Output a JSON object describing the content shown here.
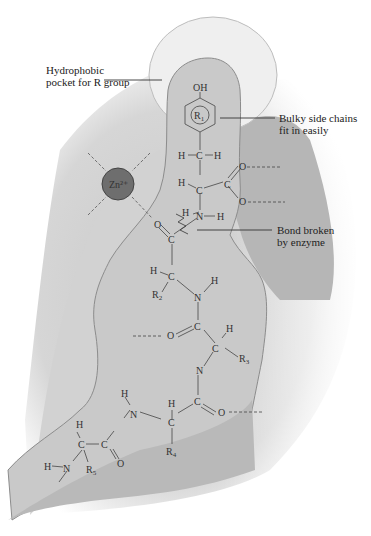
{
  "diagram": {
    "labels": {
      "hydrophobic_pocket": [
        "Hydrophobic",
        "pocket for R group"
      ],
      "bulky_side_chains": [
        "Bulky side chains",
        "fit in easily"
      ],
      "bond_broken": [
        "Bond broken",
        "by enzyme"
      ]
    },
    "metal_ion": {
      "symbol": "Zn",
      "charge": "2+",
      "color": "#6e6e6e"
    },
    "residues": [
      "R1",
      "R2",
      "R3",
      "R4",
      "R5"
    ],
    "atoms": {
      "hydroxyl": "OH",
      "ring_label": "R",
      "ring_sub": "1",
      "hydrogen": "H",
      "carbon": "C",
      "nitrogen": "N",
      "oxygen": "O"
    },
    "colors": {
      "enzyme_dark": "#b4b4b4",
      "enzyme_light": "#d2d2d2",
      "pocket": "#c6c6c6",
      "pocket_halo": "#ededed",
      "outline": "#8a8a8a"
    }
  }
}
